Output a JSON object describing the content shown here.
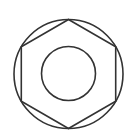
{
  "figure": {
    "width": 136,
    "height": 140,
    "stroke_color": "#333333",
    "background": "#ffffff",
    "stroke_width": 1.6,
    "outer_circle": {
      "cx": 68.5,
      "cy": 74,
      "r": 54.5
    },
    "hexagon": {
      "points": "68.5,19.5 115.7,46.8 115.7,101.2 68.5,128.5 21.3,101.2 21.3,46.8"
    },
    "inner_circle": {
      "cx": 68.5,
      "cy": 73.5,
      "r": 27
    }
  }
}
